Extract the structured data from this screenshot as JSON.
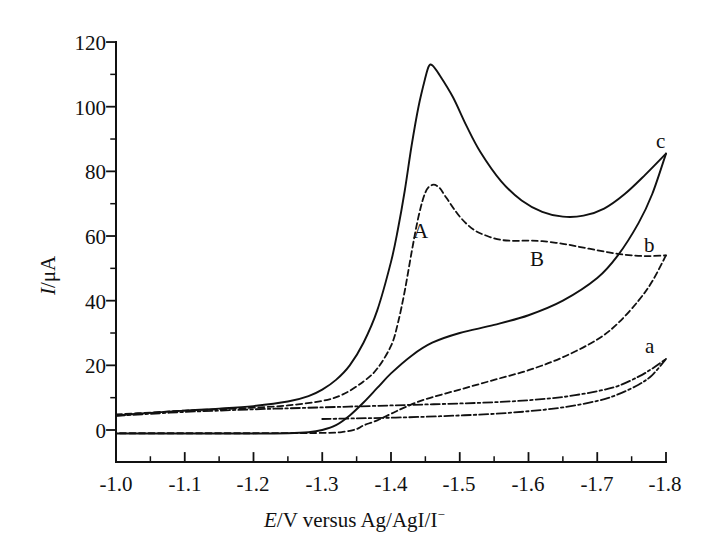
{
  "chart_data": {
    "type": "line",
    "title": "",
    "xlabel": "E/V versus Ag/AgI/I−",
    "xlabel_parts": {
      "italic": "E",
      "rest": "/V versus Ag/AgI/I",
      "superscript": "−"
    },
    "ylabel": "I/μA",
    "ylabel_parts": {
      "italic": "I",
      "rest": "/μA"
    },
    "xlim": [
      -1.0,
      -1.8
    ],
    "ylim": [
      -8,
      126
    ],
    "x_ticks": [
      "-1.0",
      "-1.1",
      "-1.2",
      "-1.3",
      "-1.4",
      "-1.5",
      "-1.6",
      "-1.7",
      "-1.8"
    ],
    "x_tick_values": [
      -1.0,
      -1.1,
      -1.2,
      -1.3,
      -1.4,
      -1.5,
      -1.6,
      -1.7,
      -1.8
    ],
    "y_ticks": [
      "0",
      "20",
      "40",
      "60",
      "80",
      "100",
      "120"
    ],
    "y_tick_values": [
      0,
      20,
      40,
      60,
      80,
      100,
      120
    ],
    "x_minor_ticks": [
      -1.05,
      -1.15,
      -1.25,
      -1.35,
      -1.45,
      -1.55,
      -1.65,
      -1.75
    ],
    "y_minor_ticks": [
      10,
      30,
      50,
      70,
      90,
      110
    ],
    "grid": false,
    "legend": "inline curve labels",
    "axis_color": "#111111",
    "curve_color": "#111111",
    "annotations": [
      {
        "text": "A",
        "x": -1.442,
        "y": 62,
        "note": "peak A on curve b"
      },
      {
        "text": "B",
        "x": -1.612,
        "y": 53,
        "note": "shoulder B on curve b"
      },
      {
        "text": "a",
        "x": -1.778,
        "y": 27,
        "note": "curve a label"
      },
      {
        "text": "b",
        "x": -1.775,
        "y": 58,
        "note": "curve b label"
      },
      {
        "text": "c",
        "x": -1.795,
        "y": 89,
        "note": "curve c label"
      }
    ],
    "series": [
      {
        "name": "a",
        "label": "a",
        "linestyle": "dashdot",
        "forward_points": [
          [
            -1.0,
            4.4
          ],
          [
            -1.05,
            5.0
          ],
          [
            -1.1,
            5.6
          ],
          [
            -1.15,
            6.0
          ],
          [
            -1.2,
            6.4
          ],
          [
            -1.25,
            6.7
          ],
          [
            -1.3,
            7.0
          ],
          [
            -1.35,
            7.3
          ],
          [
            -1.4,
            7.6
          ],
          [
            -1.45,
            7.9
          ],
          [
            -1.5,
            8.2
          ],
          [
            -1.55,
            8.6
          ],
          [
            -1.6,
            9.2
          ],
          [
            -1.65,
            10.2
          ],
          [
            -1.7,
            12.0
          ],
          [
            -1.73,
            13.6
          ],
          [
            -1.76,
            16.5
          ],
          [
            -1.78,
            19.0
          ],
          [
            -1.8,
            22.0
          ]
        ],
        "reverse_points": [
          [
            -1.8,
            22.0
          ],
          [
            -1.78,
            17.0
          ],
          [
            -1.76,
            14.0
          ],
          [
            -1.73,
            11.0
          ],
          [
            -1.7,
            9.0
          ],
          [
            -1.65,
            7.0
          ],
          [
            -1.6,
            5.8
          ],
          [
            -1.55,
            5.0
          ],
          [
            -1.5,
            4.5
          ],
          [
            -1.45,
            4.1
          ],
          [
            -1.4,
            3.8
          ],
          [
            -1.35,
            3.6
          ],
          [
            -1.3,
            3.4
          ]
        ]
      },
      {
        "name": "b",
        "label": "b",
        "linestyle": "dashed",
        "forward_points": [
          [
            -1.0,
            4.8
          ],
          [
            -1.05,
            5.4
          ],
          [
            -1.1,
            6.0
          ],
          [
            -1.15,
            6.4
          ],
          [
            -1.2,
            6.9
          ],
          [
            -1.25,
            7.6
          ],
          [
            -1.3,
            9.0
          ],
          [
            -1.33,
            11.0
          ],
          [
            -1.36,
            15.0
          ],
          [
            -1.38,
            19.0
          ],
          [
            -1.4,
            26.0
          ],
          [
            -1.41,
            33.0
          ],
          [
            -1.42,
            43.0
          ],
          [
            -1.43,
            55.0
          ],
          [
            -1.44,
            66.0
          ],
          [
            -1.45,
            73.5
          ],
          [
            -1.46,
            75.8
          ],
          [
            -1.47,
            75.0
          ],
          [
            -1.48,
            72.0
          ],
          [
            -1.5,
            66.0
          ],
          [
            -1.52,
            62.0
          ],
          [
            -1.54,
            60.0
          ],
          [
            -1.56,
            58.8
          ],
          [
            -1.58,
            58.5
          ],
          [
            -1.6,
            58.6
          ],
          [
            -1.62,
            58.4
          ],
          [
            -1.65,
            57.6
          ],
          [
            -1.68,
            56.4
          ],
          [
            -1.71,
            55.2
          ],
          [
            -1.74,
            54.2
          ],
          [
            -1.77,
            53.8
          ],
          [
            -1.8,
            54.0
          ]
        ],
        "reverse_points": [
          [
            -1.8,
            54.0
          ],
          [
            -1.78,
            46.0
          ],
          [
            -1.76,
            40.0
          ],
          [
            -1.73,
            33.0
          ],
          [
            -1.7,
            28.0
          ],
          [
            -1.65,
            22.5
          ],
          [
            -1.6,
            18.5
          ],
          [
            -1.55,
            15.5
          ],
          [
            -1.5,
            12.5
          ],
          [
            -1.45,
            9.5
          ],
          [
            -1.42,
            7.0
          ],
          [
            -1.4,
            5.0
          ],
          [
            -1.38,
            3.0
          ],
          [
            -1.36,
            1.4
          ],
          [
            -1.35,
            0.3
          ],
          [
            -1.33,
            -0.6
          ],
          [
            -1.3,
            -0.9
          ],
          [
            -1.2,
            -1.0
          ],
          [
            -1.1,
            -1.0
          ],
          [
            -1.0,
            -1.0
          ]
        ]
      },
      {
        "name": "c",
        "label": "c",
        "linestyle": "solid",
        "forward_points": [
          [
            -1.0,
            4.5
          ],
          [
            -1.05,
            5.3
          ],
          [
            -1.1,
            6.0
          ],
          [
            -1.15,
            6.6
          ],
          [
            -1.2,
            7.4
          ],
          [
            -1.25,
            8.8
          ],
          [
            -1.28,
            10.5
          ],
          [
            -1.3,
            12.5
          ],
          [
            -1.32,
            15.5
          ],
          [
            -1.34,
            20.0
          ],
          [
            -1.36,
            27.0
          ],
          [
            -1.38,
            37.0
          ],
          [
            -1.4,
            52.0
          ],
          [
            -1.41,
            62.0
          ],
          [
            -1.42,
            74.0
          ],
          [
            -1.43,
            88.0
          ],
          [
            -1.44,
            100.0
          ],
          [
            -1.45,
            109.0
          ],
          [
            -1.455,
            112.5
          ],
          [
            -1.46,
            112.8
          ],
          [
            -1.47,
            110.0
          ],
          [
            -1.49,
            103.0
          ],
          [
            -1.51,
            94.0
          ],
          [
            -1.53,
            86.0
          ],
          [
            -1.56,
            77.0
          ],
          [
            -1.59,
            71.0
          ],
          [
            -1.62,
            67.5
          ],
          [
            -1.65,
            66.0
          ],
          [
            -1.68,
            66.3
          ],
          [
            -1.71,
            68.5
          ],
          [
            -1.74,
            73.0
          ],
          [
            -1.77,
            79.0
          ],
          [
            -1.8,
            85.5
          ]
        ],
        "reverse_points": [
          [
            -1.8,
            85.5
          ],
          [
            -1.78,
            73.0
          ],
          [
            -1.76,
            64.0
          ],
          [
            -1.73,
            54.0
          ],
          [
            -1.7,
            47.0
          ],
          [
            -1.65,
            40.0
          ],
          [
            -1.6,
            35.5
          ],
          [
            -1.55,
            32.5
          ],
          [
            -1.5,
            30.0
          ],
          [
            -1.46,
            27.0
          ],
          [
            -1.43,
            23.0
          ],
          [
            -1.4,
            17.5
          ],
          [
            -1.38,
            13.0
          ],
          [
            -1.36,
            8.5
          ],
          [
            -1.34,
            4.5
          ],
          [
            -1.32,
            1.5
          ],
          [
            -1.3,
            0.0
          ],
          [
            -1.28,
            -0.7
          ],
          [
            -1.25,
            -1.0
          ],
          [
            -1.2,
            -1.1
          ],
          [
            -1.1,
            -1.1
          ],
          [
            -1.0,
            -1.1
          ]
        ]
      }
    ]
  },
  "axes": {
    "x_tick_labels": [
      "-1.0",
      "-1.1",
      "-1.2",
      "-1.3",
      "-1.4",
      "-1.5",
      "-1.6",
      "-1.7",
      "-1.8"
    ],
    "y_tick_labels": [
      "0",
      "20",
      "40",
      "60",
      "80",
      "100",
      "120"
    ],
    "x_title_italic": "E",
    "x_title_rest": "/V versus Ag/AgI/I",
    "x_title_sup": "−",
    "y_title_italic": "I",
    "y_title_rest": "/μA"
  },
  "labels": {
    "peak_A": "A",
    "peak_B": "B",
    "curve_a": "a",
    "curve_b": "b",
    "curve_c": "c"
  }
}
